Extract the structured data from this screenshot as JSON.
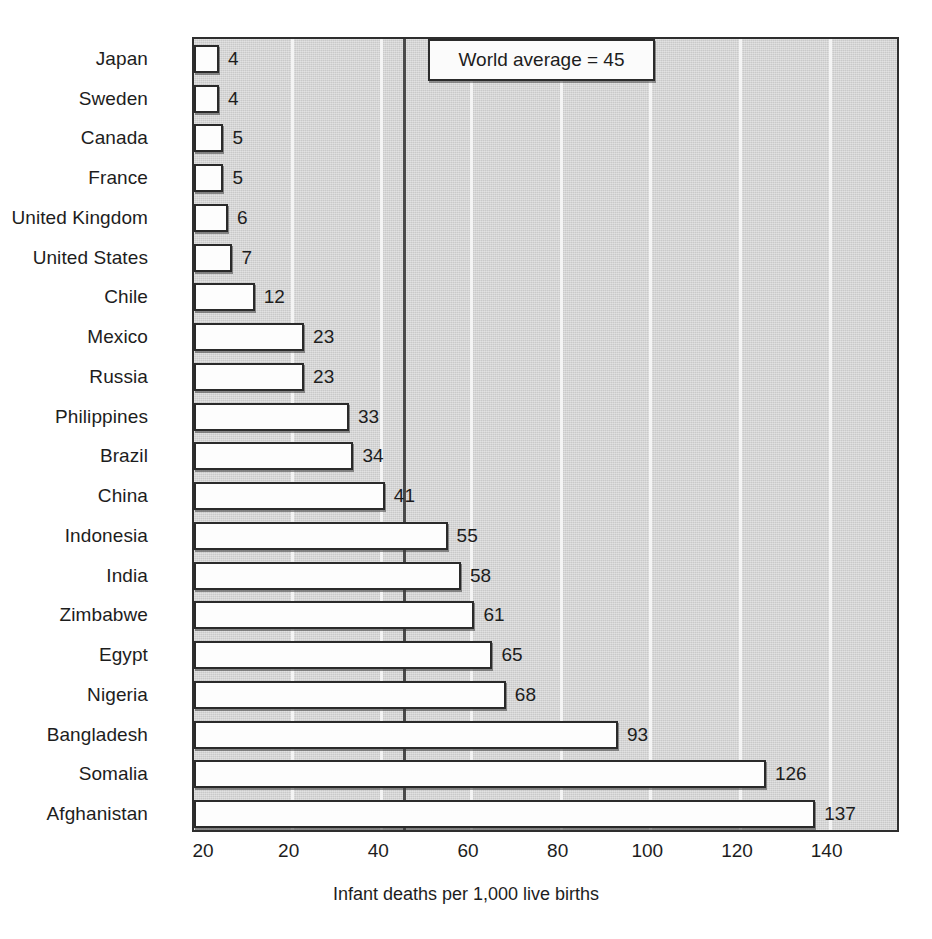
{
  "chart_data": {
    "type": "bar",
    "orientation": "horizontal",
    "title": "",
    "xlabel": "Infant deaths per 1,000 live births",
    "ylabel": "",
    "xlim": [
      0,
      158
    ],
    "grid": true,
    "xticks": [
      "20",
      "20",
      "40",
      "60",
      "80",
      "100",
      "120",
      "140"
    ],
    "xtick_values": [
      0,
      20,
      40,
      60,
      80,
      100,
      120,
      140
    ],
    "categories": [
      "Japan",
      "Sweden",
      "Canada",
      "France",
      "United Kingdom",
      "United States",
      "Chile",
      "Mexico",
      "Russia",
      "Philippines",
      "Brazil",
      "China",
      "Indonesia",
      "India",
      "Zimbabwe",
      "Egypt",
      "Nigeria",
      "Bangladesh",
      "Somalia",
      "Afghanistan"
    ],
    "values": [
      4,
      4,
      5,
      5,
      6,
      7,
      12,
      23,
      23,
      33,
      34,
      41,
      55,
      58,
      61,
      65,
      68,
      93,
      126,
      137
    ],
    "value_labels": [
      "4",
      "4",
      "5",
      "5",
      "6",
      "7",
      "12",
      "23",
      "23",
      "33",
      "34",
      "41",
      "55",
      "58",
      "61",
      "65",
      "68",
      "93",
      "126",
      "137"
    ],
    "annotation": {
      "text": "World average = 45",
      "value": 45
    },
    "colors": {
      "plot_background": "#c9c9c9",
      "bar_fill": "#fdfdfd",
      "bar_edge": "#2a2a2a",
      "gridline": "#f4f4f4",
      "average_line": "#4a4a4a",
      "text": "#1d1d1d"
    }
  }
}
